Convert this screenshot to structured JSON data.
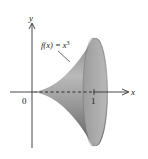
{
  "figure": {
    "function_label": "f(x) = x³",
    "function_label_main": "f(x) = x",
    "function_label_exp": "3",
    "axes": {
      "x_label": "x",
      "y_label": "y",
      "origin_label": "0",
      "x_tick_label": "1"
    },
    "colors": {
      "solid_light": "#e2e2e2",
      "solid_mid": "#a8a8a8",
      "solid_dark": "#6e6e6e",
      "cap": "#9a9a9a",
      "axis": "#333333",
      "background": "#ffffff"
    }
  }
}
